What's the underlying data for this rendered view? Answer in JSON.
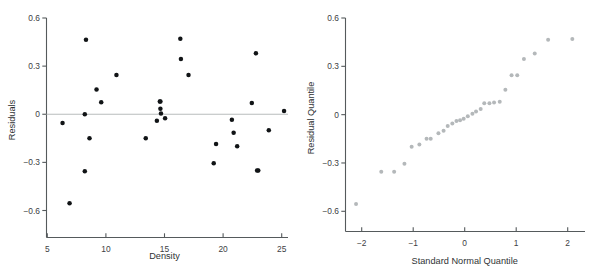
{
  "figure": {
    "background": "#ffffff",
    "point_color_left": "#111416",
    "point_color_right": "#b4b8ba",
    "axis_color": "#555a5c",
    "zero_line_color": "#b9bcbd"
  },
  "chart_data": [
    {
      "type": "scatter",
      "panel": "left",
      "title": "",
      "xlabel": "Density",
      "ylabel": "Residuals",
      "xlim": [
        5,
        25.6
      ],
      "ylim": [
        -0.72,
        0.6
      ],
      "xticks": [
        5,
        10,
        15,
        20,
        25
      ],
      "xticklabels": [
        "5",
        "10",
        "15",
        "20",
        "25"
      ],
      "yticks": [
        -0.6,
        -0.3,
        0,
        0.3,
        0.6
      ],
      "yticklabels": [
        "-0.6",
        "-0.3",
        "0",
        "0.3",
        "0.6"
      ],
      "grid": false,
      "legend": null,
      "reference_line": {
        "type": "horizontal",
        "y": 0,
        "color": "#b9bcbd"
      },
      "x": [
        6.3,
        6.9,
        8.2,
        8.2,
        8.3,
        8.6,
        9.2,
        9.6,
        10.9,
        13.4,
        14.35,
        14.6,
        14.65,
        14.65,
        14.7,
        15.05,
        16.35,
        16.4,
        17.05,
        19.2,
        19.4,
        20.75,
        20.9,
        21.2,
        22.45,
        22.8,
        22.9,
        23.0,
        23.9,
        25.2
      ],
      "y": [
        -0.055,
        -0.555,
        0.0,
        -0.355,
        0.465,
        -0.15,
        0.155,
        0.075,
        0.245,
        -0.15,
        -0.04,
        0.08,
        0.08,
        0.035,
        0.005,
        -0.025,
        0.47,
        0.345,
        0.245,
        -0.305,
        -0.185,
        -0.035,
        -0.115,
        -0.2,
        0.07,
        0.38,
        -0.35,
        -0.35,
        -0.1,
        0.02
      ]
    },
    {
      "type": "scatter",
      "panel": "right",
      "title": "",
      "xlabel": "Standard Normal Quantile",
      "ylabel": "Residual Quantile",
      "xlim": [
        -2.35,
        2.35
      ],
      "ylim": [
        -0.72,
        0.6
      ],
      "xticks": [
        -2,
        -1,
        0,
        1,
        2
      ],
      "xticklabels": [
        "-2",
        "-1",
        "0",
        "1",
        "2"
      ],
      "yticks": [
        -0.6,
        -0.3,
        0,
        0.3,
        0.6
      ],
      "yticklabels": [
        "-0.6",
        "-0.3",
        "0",
        "0.3",
        "0.6"
      ],
      "grid": false,
      "legend": null,
      "x": [
        -2.11,
        -1.62,
        -1.37,
        -1.17,
        -1.03,
        -0.88,
        -0.74,
        -0.66,
        -0.51,
        -0.41,
        -0.33,
        -0.24,
        -0.16,
        -0.09,
        -0.02,
        0.06,
        0.15,
        0.22,
        0.31,
        0.38,
        0.48,
        0.57,
        0.68,
        0.79,
        0.91,
        1.02,
        1.15,
        1.36,
        1.62,
        2.09
      ],
      "y": [
        -0.555,
        -0.355,
        -0.355,
        -0.305,
        -0.2,
        -0.185,
        -0.15,
        -0.15,
        -0.115,
        -0.1,
        -0.07,
        -0.055,
        -0.04,
        -0.035,
        -0.025,
        -0.01,
        0.005,
        0.02,
        0.035,
        0.07,
        0.07,
        0.075,
        0.08,
        0.155,
        0.245,
        0.245,
        0.345,
        0.38,
        0.465,
        0.47
      ]
    }
  ]
}
